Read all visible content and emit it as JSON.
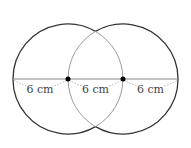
{
  "diagram": {
    "type": "two-overlapping-circles",
    "circles": [
      {
        "id": "left",
        "cx": 68,
        "cy": 79,
        "r": 55
      },
      {
        "id": "right",
        "cx": 123,
        "cy": 79,
        "r": 55
      }
    ],
    "centers": [
      {
        "x": 68,
        "y": 79
      },
      {
        "x": 123,
        "y": 79
      }
    ],
    "segments": [
      {
        "label": "6 cm",
        "x1": 13,
        "x2": 68
      },
      {
        "label": "6 cm",
        "x1": 68,
        "x2": 123
      },
      {
        "label": "6 cm",
        "x1": 123,
        "x2": 179
      }
    ],
    "colors": {
      "outer_stroke": "#333333",
      "inner_stroke": "#999999",
      "line": "#888888",
      "dotted": "#aaaaaa",
      "point": "#000000"
    }
  }
}
